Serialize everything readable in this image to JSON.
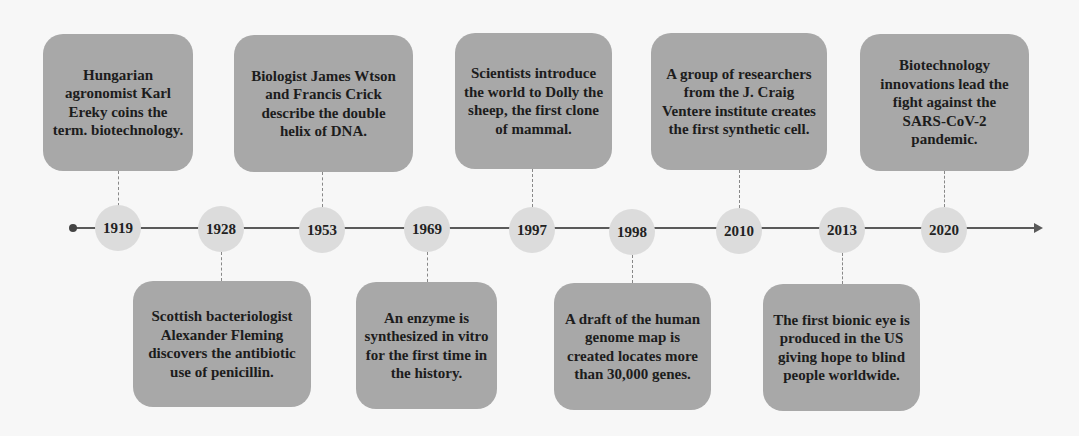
{
  "timeline": {
    "events": [
      {
        "year": "1919",
        "text": "Hungarian agronomist Karl Ereky coins the term. biotechnology.",
        "position": "above"
      },
      {
        "year": "1928",
        "text": "Scottish bacteriologist Alexander Fleming discovers the antibiotic use of penicillin.",
        "position": "below"
      },
      {
        "year": "1953",
        "text": "Biologist James Wtson and Francis Crick describe the double helix of DNA.",
        "position": "above"
      },
      {
        "year": "1969",
        "text": "An enzyme is synthesized in vitro for the first time in the history.",
        "position": "below"
      },
      {
        "year": "1997",
        "text": "Scientists introduce the world to Dolly the sheep, the first clone of mammal.",
        "position": "above"
      },
      {
        "year": "1998",
        "text": "A draft of the human genome map is created locates more than 30,000 genes.",
        "position": "below"
      },
      {
        "year": "2010",
        "text": "A group of researchers from the J. Craig Ventere institute creates the first synthetic cell.",
        "position": "above"
      },
      {
        "year": "2013",
        "text": "The first bionic eye is produced in the US giving hope to blind people worldwide.",
        "position": "below"
      },
      {
        "year": "2020",
        "text": "Biotechnology innovations lead the fight against the SARS-CoV-2 pandemic.",
        "position": "above"
      }
    ]
  },
  "colors": {
    "box": "#a8a8a8",
    "circle": "#dcdcdc",
    "line": "#5a5a5a",
    "text": "#1c1c1c"
  }
}
